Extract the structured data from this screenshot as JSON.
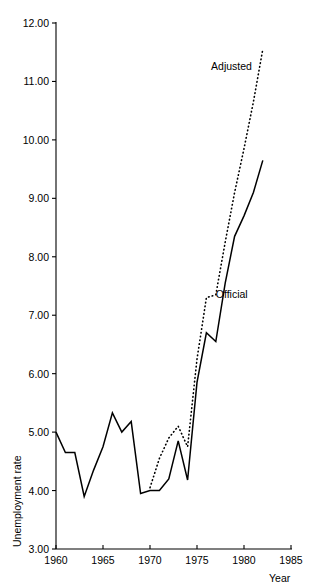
{
  "chart_data": {
    "type": "line",
    "title": "",
    "xlabel": "Year",
    "ylabel": "Unemployment rate",
    "xlim": [
      1960,
      1985
    ],
    "ylim": [
      3.0,
      12.0
    ],
    "xticks": [
      "1960",
      "1965",
      "1970",
      "1975",
      "1980",
      "1985"
    ],
    "xtick_values": [
      1960,
      1965,
      1970,
      1975,
      1980,
      1985
    ],
    "yticks": [
      "3.00",
      "4.00",
      "5.00",
      "6.00",
      "7.00",
      "8.00",
      "9.00",
      "10.00",
      "11.00",
      "12.00"
    ],
    "ytick_values": [
      3.0,
      4.0,
      5.0,
      6.0,
      7.0,
      8.0,
      9.0,
      10.0,
      11.0,
      12.0
    ],
    "grid": false,
    "legend_position": "inline-annotation",
    "series": [
      {
        "name": "Official",
        "style": "solid",
        "color": "#000000",
        "label_x": 1977.0,
        "label_y": 7.35,
        "x": [
          1960,
          1961,
          1962,
          1963,
          1964,
          1965,
          1966,
          1967,
          1968,
          1969,
          1970,
          1971,
          1972,
          1973,
          1974,
          1975,
          1976,
          1977,
          1978,
          1979,
          1980,
          1981,
          1982
        ],
        "values": [
          5.0,
          4.65,
          4.65,
          3.9,
          4.35,
          4.75,
          5.33,
          5.0,
          5.18,
          3.95,
          4.0,
          4.0,
          4.2,
          4.85,
          4.18,
          5.85,
          6.7,
          6.55,
          7.55,
          8.35,
          8.7,
          9.1,
          9.65
        ]
      },
      {
        "name": "Adjusted",
        "style": "dotted",
        "color": "#000000",
        "label_x": 1976.5,
        "label_y": 11.25,
        "x": [
          1970,
          1971,
          1972,
          1973,
          1974,
          1975,
          1976,
          1977,
          1978,
          1979,
          1980,
          1981,
          1982
        ],
        "values": [
          4.05,
          4.55,
          4.9,
          5.1,
          4.75,
          6.25,
          7.3,
          7.35,
          8.25,
          9.1,
          9.85,
          10.65,
          11.55
        ]
      }
    ]
  },
  "axes": {
    "x_axis_name": "year-axis",
    "y_axis_name": "unemployment-rate-axis"
  }
}
